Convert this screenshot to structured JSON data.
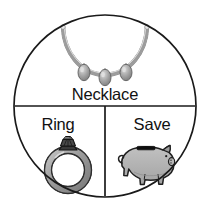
{
  "figure": {
    "type": "pie-style-word-diagram",
    "shape": "circle-divided-into-three-sectors",
    "background_color": "#ffffff",
    "outline_color": "#1a1a1a"
  },
  "circle": {
    "center_x": 105,
    "center_y": 106,
    "radius": 91,
    "stroke_width": 1.6
  },
  "dividers": {
    "horizontal_y": 106,
    "vertical_x": 105,
    "stroke_width": 1.6
  },
  "sections": [
    {
      "id": "necklace",
      "label": "Necklace",
      "label_x": 105,
      "label_y": 100,
      "icon_name": "necklace-icon",
      "icon_description": "beaded pearl chain with three teardrop pendants",
      "colors": {
        "chain": "#b9b9b9",
        "bead_fill": "#f2f2f2",
        "pendant_fill": "#9a9a9a",
        "pendant_stroke": "#5a5a5a"
      },
      "pendant_count": 3
    },
    {
      "id": "ring",
      "label": "Ring",
      "label_x": 58,
      "label_y": 130,
      "icon_name": "ring-icon",
      "icon_description": "gray ring band with dark faceted gemstone on top",
      "colors": {
        "band_fill": "#9e9e9e",
        "band_stroke": "#2b2b2b",
        "gem_fill": "#3d3d3d",
        "gem_stroke": "#141414"
      }
    },
    {
      "id": "save",
      "label": "Save",
      "label_x": 152,
      "label_y": 130,
      "icon_name": "piggy-bank-icon",
      "icon_description": "gray piggy bank standing in profile with black coin slot on its back",
      "colors": {
        "body_fill": "#b0b0b0",
        "body_stroke": "#1f1f1f",
        "slot_fill": "#101010"
      }
    }
  ]
}
